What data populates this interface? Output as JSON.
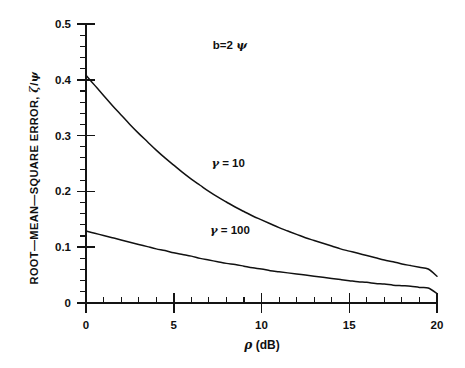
{
  "chart_data": {
    "type": "line",
    "title": "",
    "subtitle": "",
    "xlabel": "ρ (dB)",
    "ylabel": "ROOT—MEAN—SQUARE ERROR, ζ/ψ",
    "xlim": [
      0,
      20
    ],
    "ylim": [
      0,
      0.5
    ],
    "grid": false,
    "legend_position": "inline-annotation",
    "xticks": [
      0,
      5,
      10,
      15,
      20
    ],
    "xticklabels": [
      "0",
      "5",
      "10",
      "15",
      "20"
    ],
    "x_minor_tick_step": 1,
    "yticks": [
      0,
      0.1,
      0.2,
      0.3,
      0.4,
      0.5
    ],
    "yticklabels": [
      "0",
      "0.1",
      "0.2",
      "0.3",
      "0.4",
      "0.5"
    ],
    "y_minor_tick_step": 0.02,
    "annotations": [
      {
        "text": "b=2 ψ",
        "x": 8.2,
        "y": 0.455
      },
      {
        "text": "γ = 10",
        "x": 8.1,
        "y": 0.243
      },
      {
        "text": "γ = 100",
        "x": 8.2,
        "y": 0.123
      }
    ],
    "x": [
      0,
      0.5,
      1,
      1.5,
      2,
      2.5,
      3,
      3.5,
      4,
      4.5,
      5,
      5.5,
      6,
      6.5,
      7,
      7.5,
      8,
      8.5,
      9,
      9.5,
      10,
      10.5,
      11,
      11.5,
      12,
      12.5,
      13,
      13.5,
      14,
      14.5,
      15,
      15.5,
      16,
      16.5,
      17,
      17.5,
      18,
      18.5,
      19,
      19.5,
      20
    ],
    "series": [
      {
        "name": "γ = 10",
        "label": "γ = 10",
        "color": "#111111",
        "values": [
          0.408,
          0.39,
          0.372,
          0.354,
          0.337,
          0.32,
          0.304,
          0.289,
          0.274,
          0.26,
          0.247,
          0.234,
          0.222,
          0.211,
          0.2,
          0.19,
          0.181,
          0.172,
          0.164,
          0.156,
          0.149,
          0.142,
          0.135,
          0.129,
          0.123,
          0.117,
          0.112,
          0.107,
          0.102,
          0.097,
          0.093,
          0.089,
          0.085,
          0.081,
          0.077,
          0.074,
          0.07,
          0.067,
          0.064,
          0.061,
          0.048
        ]
      },
      {
        "name": "γ = 100",
        "label": "γ = 100",
        "color": "#111111",
        "values": [
          0.129,
          0.125,
          0.121,
          0.117,
          0.113,
          0.109,
          0.105,
          0.101,
          0.097,
          0.094,
          0.09,
          0.087,
          0.084,
          0.08,
          0.077,
          0.074,
          0.071,
          0.069,
          0.066,
          0.063,
          0.061,
          0.058,
          0.056,
          0.054,
          0.052,
          0.05,
          0.048,
          0.046,
          0.044,
          0.042,
          0.04,
          0.038,
          0.037,
          0.035,
          0.034,
          0.032,
          0.031,
          0.03,
          0.028,
          0.027,
          0.017
        ]
      }
    ]
  },
  "axes": {
    "y_axis_name": "root-mean-square-error-axis",
    "x_axis_name": "rho-axis"
  }
}
